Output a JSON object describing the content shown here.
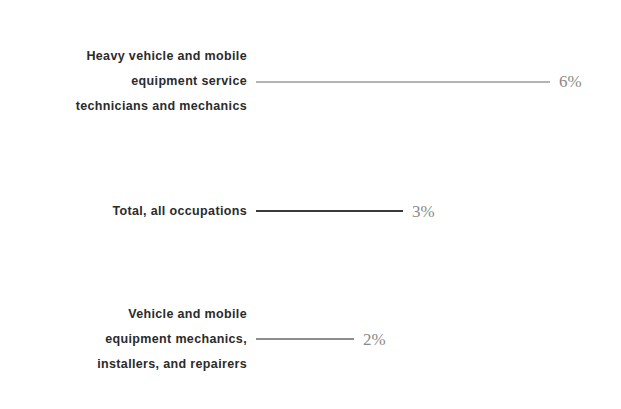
{
  "chart_data": {
    "type": "bar",
    "orientation": "horizontal",
    "title": "",
    "subtitle": "",
    "xlabel": "",
    "ylabel": "",
    "grid": false,
    "legend": "none",
    "axis_visible": false,
    "xlim": [
      0,
      6
    ],
    "categories": [
      "Heavy vehicle and mobile\nequipment service\ntechnicians and mechanics",
      "Total, all occupations",
      "Vehicle and mobile\nequipment mechanics,\ninstallers, and repairers"
    ],
    "values": [
      6,
      3,
      2
    ],
    "value_labels": [
      "6%",
      "3%",
      "2%"
    ],
    "bar_colors": [
      "#e1e1e1",
      "#474747",
      "#9a9a9a"
    ],
    "bar_border_colors": [
      "#b4b4b4",
      "#3a3a3a",
      "#8d8d8d"
    ],
    "background_color": "#ffffff",
    "label_color": "#2b2b2b",
    "value_label_color": "#8a8a8a"
  },
  "rows": [
    {
      "label": "Heavy vehicle and mobile\nequipment service\ntechnicians and mechanics",
      "value_label": "6%"
    },
    {
      "label": "Total, all occupations",
      "value_label": "3%"
    },
    {
      "label": "Vehicle and mobile\nequipment mechanics,\ninstallers, and repairers",
      "value_label": "2%"
    }
  ]
}
